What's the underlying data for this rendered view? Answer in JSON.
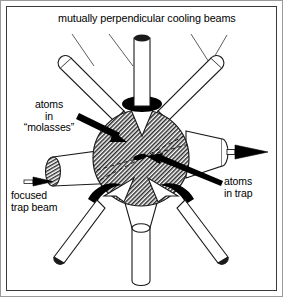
{
  "figure": {
    "kind": "magneto-optical-trap-diagram",
    "background_color": "#ffffff",
    "ink_color": "#000000",
    "frame_color": "#3a3a3a",
    "outer_frame_color": "#9a9a9a",
    "width": 283,
    "height": 297
  },
  "labels": {
    "title": "mutually perpendicular cooling beams",
    "molasses": "atoms\nin\n“molasses”",
    "focused_trap_beam": "focused\ntrap beam",
    "atoms_in_trap": "atoms\nin trap"
  },
  "diagram_data": {
    "type": "schematic",
    "center": {
      "x": 141,
      "y": 158
    },
    "atom_cloud": {
      "name": "atoms in molasses",
      "shape": "sphere",
      "radius": 48,
      "fill": "hatched",
      "hatch_color": "#2b2b2b"
    },
    "trapped_atoms": {
      "name": "atoms in trap",
      "shape": "small filled ellipse",
      "x": 141,
      "y": 158,
      "rx": 7,
      "ry": 2.6,
      "fill": "#000000"
    },
    "cooling_beams": [
      {
        "id": "top",
        "angle_deg": 90,
        "style": "cylinder-with-lens",
        "collar": "black"
      },
      {
        "id": "bottom",
        "angle_deg": 270,
        "style": "cylinder-with-funnel",
        "collar": "none"
      },
      {
        "id": "upper-left",
        "angle_deg": 143,
        "style": "tube-with-cone",
        "collar": "none"
      },
      {
        "id": "upper-right",
        "angle_deg": 37,
        "style": "tube-with-cone",
        "collar": "none"
      },
      {
        "id": "lower-left",
        "angle_deg": 217,
        "style": "tube-with-lens",
        "collar": "black"
      },
      {
        "id": "lower-right",
        "angle_deg": 323,
        "style": "tube-with-lens",
        "collar": "black"
      }
    ],
    "trap_beam": {
      "id": "focused-trap-beam",
      "direction": "left-to-right",
      "style": "truncated-cone-with-hatched-end",
      "arrow": "black"
    },
    "exit_beam": {
      "id": "right-exit-beam",
      "direction": "left-to-right",
      "style": "truncated-cone",
      "arrow": "black"
    },
    "leader_lines": 4,
    "dashed_axes": 2
  }
}
